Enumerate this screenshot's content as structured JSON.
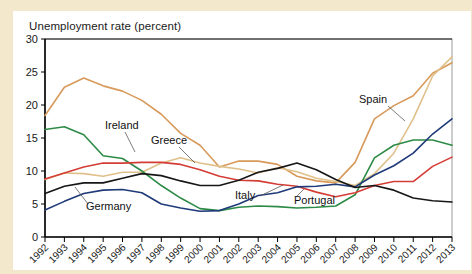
{
  "chart_data": {
    "type": "line",
    "title": "Unemployment rate (percent)",
    "xlabel": "",
    "ylabel": "Unemployment rate (percent)",
    "ylim": [
      0,
      30
    ],
    "yticks": [
      0,
      5,
      10,
      15,
      20,
      25,
      30
    ],
    "grid": false,
    "legend_position": "inline-annotations",
    "x": [
      1992,
      1993,
      1994,
      1995,
      1996,
      1997,
      1998,
      1999,
      2000,
      2001,
      2002,
      2003,
      2004,
      2005,
      2006,
      2007,
      2008,
      2009,
      2010,
      2011,
      2012,
      2013
    ],
    "categories": [
      "1992",
      "1993",
      "1994",
      "1995",
      "1996",
      "1997",
      "1998",
      "1999",
      "2000",
      "2001",
      "2002",
      "2003",
      "2004",
      "2005",
      "2006",
      "2007",
      "2008",
      "2009",
      "2010",
      "2011",
      "2012",
      "2013"
    ],
    "series": [
      {
        "name": "Spain",
        "color": "#d79a5b",
        "label_x": 1999.6,
        "label_y": 22.0,
        "values": [
          18.4,
          22.7,
          24.1,
          22.9,
          22.1,
          20.7,
          18.6,
          15.7,
          13.9,
          10.6,
          11.5,
          11.5,
          11.0,
          9.2,
          8.5,
          8.2,
          11.3,
          17.9,
          19.9,
          21.4,
          24.8,
          26.4
        ]
      },
      {
        "name": "Greece",
        "color": "#e0c08a",
        "label_x": 1995.2,
        "label_y": 15.3,
        "values": [
          8.7,
          9.7,
          9.6,
          9.2,
          9.8,
          9.8,
          11.2,
          12.0,
          11.2,
          10.7,
          10.3,
          9.7,
          10.5,
          9.9,
          8.9,
          8.4,
          7.8,
          9.6,
          12.7,
          17.9,
          24.4,
          27.3
        ]
      },
      {
        "name": "Ireland",
        "color": "#2e8b47",
        "label_x": 1993.6,
        "label_y": 16.6,
        "values": [
          16.3,
          16.7,
          15.5,
          12.3,
          11.9,
          10.0,
          7.8,
          5.9,
          4.3,
          4.0,
          4.5,
          4.7,
          4.6,
          4.4,
          4.5,
          4.7,
          6.4,
          12.0,
          13.9,
          14.7,
          14.7,
          13.9
        ]
      },
      {
        "name": "Italy",
        "color": "#d43d36",
        "label_x": 1999.4,
        "label_y": 7.3,
        "values": [
          8.8,
          9.7,
          10.6,
          11.2,
          11.2,
          11.3,
          11.3,
          11.0,
          10.2,
          9.2,
          8.6,
          8.5,
          8.0,
          7.7,
          6.8,
          6.1,
          6.7,
          7.8,
          8.4,
          8.4,
          10.7,
          12.1
        ]
      },
      {
        "name": "Portugal",
        "color": "#1f3a78",
        "label_x": 2002.4,
        "label_y": 6.6,
        "values": [
          4.1,
          5.4,
          6.6,
          7.1,
          7.2,
          6.7,
          5.0,
          4.4,
          3.9,
          4.0,
          5.0,
          6.3,
          6.7,
          7.6,
          7.7,
          8.0,
          7.6,
          9.4,
          10.8,
          12.7,
          15.6,
          17.9
        ]
      },
      {
        "name": "Germany",
        "color": "#171717",
        "label_x": 1994.6,
        "label_y": 4.1,
        "values": [
          6.6,
          7.7,
          8.2,
          8.2,
          8.9,
          9.6,
          9.3,
          8.5,
          7.8,
          7.8,
          8.6,
          9.8,
          10.4,
          11.2,
          10.2,
          8.7,
          7.5,
          7.8,
          7.1,
          5.9,
          5.5,
          5.3
        ]
      }
    ]
  }
}
